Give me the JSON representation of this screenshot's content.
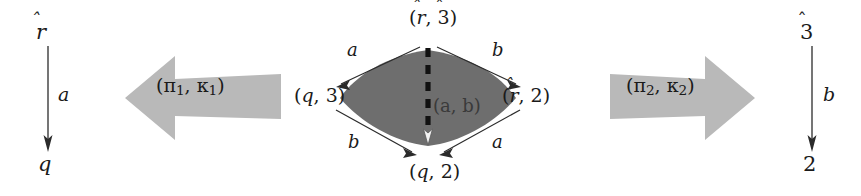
{
  "figure": {
    "background_color": "#ffffff",
    "ink_color": "#1a1a1a",
    "block_arrow_color": "#b9b9b9",
    "lens_fill_color": "#6e6e6e"
  },
  "left_axis": {
    "name": "left-component-automaton",
    "top_label": "r",
    "top_label_hat": true,
    "bottom_label": "q",
    "edge_label": "a",
    "direction": "down"
  },
  "right_axis": {
    "name": "right-component-automaton",
    "top_label": "3",
    "top_label_hat": true,
    "bottom_label": "2",
    "edge_label": "b",
    "direction": "down"
  },
  "block_arrows": [
    {
      "name": "projection-arrow-left",
      "label": "(π1, κ1)",
      "label_base": "(π",
      "label_sub1": "1",
      "label_mid": ", κ",
      "label_sub2": "1",
      "label_end": ")",
      "direction": "left",
      "color": "#b9b9b9"
    },
    {
      "name": "projection-arrow-right",
      "label": "(π2, κ2)",
      "label_base": "(π",
      "label_sub1": "2",
      "label_mid": ", κ",
      "label_sub2": "2",
      "label_end": ")",
      "direction": "right",
      "color": "#b9b9b9"
    }
  ],
  "diagram": {
    "name": "product-lens-diagram",
    "vertices": {
      "top": {
        "text": "(r̂, 3̂)",
        "open": "(",
        "first": "r",
        "first_hat": true,
        "sep": ", ",
        "second": "3",
        "second_hat": true,
        "close": ")"
      },
      "left": {
        "text": "(q, 3)",
        "open": "(",
        "first": "q",
        "first_hat": false,
        "sep": ", ",
        "second": "3",
        "second_hat": false,
        "close": ")"
      },
      "right": {
        "text": "(r̂, 2)",
        "open": "(",
        "first": "r",
        "first_hat": true,
        "sep": ", ",
        "second": "2",
        "second_hat": false,
        "close": ")"
      },
      "bottom": {
        "text": "(q, 2)",
        "open": "(",
        "first": "q",
        "first_hat": false,
        "sep": ", ",
        "second": "2",
        "second_hat": false,
        "close": ")"
      }
    },
    "edges": [
      {
        "name": "edge-top-left",
        "label": "a",
        "from": "top",
        "to": "left"
      },
      {
        "name": "edge-top-right",
        "label": "b",
        "from": "top",
        "to": "right"
      },
      {
        "name": "edge-bottom-left",
        "label": "b",
        "from": "left",
        "to": "bottom"
      },
      {
        "name": "edge-bottom-right",
        "label": "a",
        "from": "right",
        "to": "bottom"
      }
    ],
    "center_edge": {
      "name": "edge-center-dashed",
      "label": "(a, b)",
      "style": "dashed",
      "from": "top",
      "to": "bottom"
    }
  }
}
